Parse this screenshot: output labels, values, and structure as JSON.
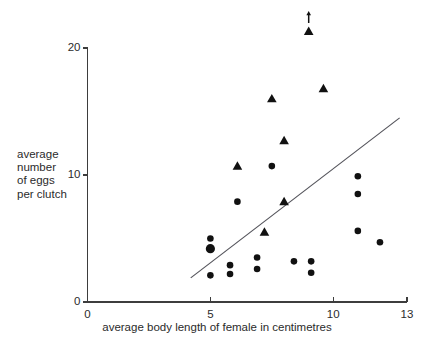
{
  "chart_data": {
    "type": "scatter",
    "title": "",
    "subtitle": "",
    "xlabel": "average body length of female in centimetres",
    "ylabel": "average\nnumber\nof eggs\nper clutch",
    "xlim": [
      0,
      13
    ],
    "ylim": [
      0,
      21.6
    ],
    "xticks": [
      0,
      5,
      10,
      13
    ],
    "xticklabels": [
      "0",
      "5",
      "10",
      "13"
    ],
    "yticks": [
      0,
      10,
      20
    ],
    "yticklabels": [
      "0",
      "10",
      "20"
    ],
    "grid": false,
    "legend": "none",
    "marker_color": "#111111",
    "axis_color": "#3d3d3d",
    "trend_line_color": "#53535a",
    "annotations": [
      {
        "name": "off-scale-arrow",
        "text": "",
        "x": 9.0,
        "y": 22.4,
        "note": "upward arrow above highest triangle indicating value beyond axis"
      }
    ],
    "trend_line": {
      "x1": 4.2,
      "y1": 1.9,
      "x2": 12.7,
      "y2": 14.5
    },
    "series": [
      {
        "name": "circles",
        "marker": "circle",
        "points": [
          {
            "x": 5.0,
            "y": 5.0,
            "size": "small"
          },
          {
            "x": 5.0,
            "y": 4.2,
            "size": "large"
          },
          {
            "x": 5.0,
            "y": 2.1,
            "size": "small"
          },
          {
            "x": 5.8,
            "y": 2.9,
            "size": "small"
          },
          {
            "x": 5.8,
            "y": 2.2,
            "size": "small"
          },
          {
            "x": 6.1,
            "y": 7.9,
            "size": "small"
          },
          {
            "x": 6.9,
            "y": 3.5,
            "size": "small"
          },
          {
            "x": 6.9,
            "y": 2.6,
            "size": "small"
          },
          {
            "x": 7.5,
            "y": 10.7,
            "size": "small"
          },
          {
            "x": 8.4,
            "y": 3.2,
            "size": "small"
          },
          {
            "x": 9.1,
            "y": 3.2,
            "size": "small"
          },
          {
            "x": 9.1,
            "y": 2.3,
            "size": "small"
          },
          {
            "x": 11.0,
            "y": 9.9,
            "size": "small"
          },
          {
            "x": 11.0,
            "y": 8.5,
            "size": "small"
          },
          {
            "x": 11.0,
            "y": 5.6,
            "size": "small"
          },
          {
            "x": 11.9,
            "y": 4.7,
            "size": "small"
          }
        ]
      },
      {
        "name": "triangles",
        "marker": "triangle",
        "points": [
          {
            "x": 6.1,
            "y": 10.7,
            "size": "small"
          },
          {
            "x": 7.2,
            "y": 5.5,
            "size": "small"
          },
          {
            "x": 7.5,
            "y": 16.0,
            "size": "small"
          },
          {
            "x": 8.0,
            "y": 12.7,
            "size": "small"
          },
          {
            "x": 8.0,
            "y": 7.9,
            "size": "small"
          },
          {
            "x": 9.0,
            "y": 21.3,
            "size": "small"
          },
          {
            "x": 9.6,
            "y": 16.8,
            "size": "small"
          }
        ]
      }
    ]
  }
}
